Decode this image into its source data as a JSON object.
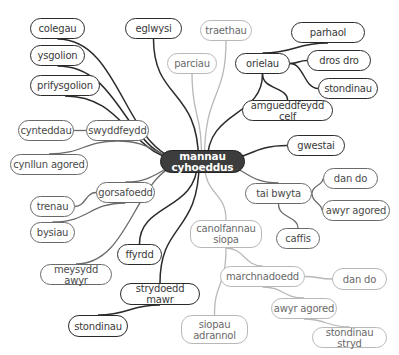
{
  "diagram": {
    "type": "mind-map",
    "center": {
      "id": "center",
      "label": "mannau\ncyhoeddus"
    },
    "colors": {
      "center_fill": "#3d3d3d",
      "center_text": "#ffffff",
      "dark_branch": "#2b2b2b",
      "mid_branch": "#6a6a6a",
      "light_branch": "#b8b8b8"
    },
    "nodes": [
      {
        "id": "colegau",
        "label": "colegau",
        "style": "dark",
        "x": 30,
        "y": 18,
        "w": 55,
        "h": 21
      },
      {
        "id": "ysgolion",
        "label": "ysgolion",
        "style": "dark",
        "x": 30,
        "y": 45,
        "w": 55,
        "h": 21
      },
      {
        "id": "prifysgolion",
        "label": "prifysgolion",
        "style": "dark",
        "x": 30,
        "y": 75,
        "w": 70,
        "h": 21
      },
      {
        "id": "eglwysi",
        "label": "eglwysi",
        "style": "dark",
        "x": 125,
        "y": 18,
        "w": 57,
        "h": 21
      },
      {
        "id": "traethau",
        "label": "traethau",
        "style": "light",
        "x": 200,
        "y": 20,
        "w": 52,
        "h": 21
      },
      {
        "id": "parciau",
        "label": "parciau",
        "style": "light",
        "x": 167,
        "y": 53,
        "w": 50,
        "h": 21
      },
      {
        "id": "orielau",
        "label": "orielau",
        "style": "dark",
        "x": 235,
        "y": 53,
        "w": 55,
        "h": 21
      },
      {
        "id": "parhaol",
        "label": "parhaol",
        "style": "dark",
        "x": 291,
        "y": 22,
        "w": 74,
        "h": 21
      },
      {
        "id": "dros_dro",
        "label": "dros dro",
        "style": "dark",
        "x": 307,
        "y": 50,
        "w": 64,
        "h": 21
      },
      {
        "id": "stondinau_tr",
        "label": "stondinau",
        "style": "dark",
        "x": 318,
        "y": 78,
        "w": 60,
        "h": 21
      },
      {
        "id": "amgueddfeydd_celf",
        "label": "amgueddfeydd celf",
        "style": "dark",
        "x": 242,
        "y": 100,
        "w": 91,
        "h": 21
      },
      {
        "id": "gwestai",
        "label": "gwestai",
        "style": "dark",
        "x": 287,
        "y": 135,
        "w": 58,
        "h": 21
      },
      {
        "id": "cynteddau",
        "label": "cynteddau",
        "style": "mid",
        "x": 18,
        "y": 120,
        "w": 56,
        "h": 21
      },
      {
        "id": "swyddfeydd",
        "label": "swyddfeydd",
        "style": "mid",
        "x": 86,
        "y": 120,
        "w": 63,
        "h": 21
      },
      {
        "id": "cynllun_agored",
        "label": "cynllun agored",
        "style": "mid",
        "x": 10,
        "y": 154,
        "w": 78,
        "h": 21
      },
      {
        "id": "gorsafoedd",
        "label": "gorsafoedd",
        "style": "mid",
        "x": 96,
        "y": 182,
        "w": 59,
        "h": 21
      },
      {
        "id": "tai_bwyta",
        "label": "tai bwyta",
        "style": "mid",
        "x": 245,
        "y": 183,
        "w": 67,
        "h": 21
      },
      {
        "id": "dan_do_r",
        "label": "dan do",
        "style": "mid",
        "x": 323,
        "y": 168,
        "w": 55,
        "h": 21
      },
      {
        "id": "awyr_agored_r",
        "label": "awyr agored",
        "style": "mid",
        "x": 322,
        "y": 200,
        "w": 68,
        "h": 21
      },
      {
        "id": "trenau",
        "label": "trenau",
        "style": "mid",
        "x": 30,
        "y": 196,
        "w": 45,
        "h": 21
      },
      {
        "id": "bysiau",
        "label": "bysiau",
        "style": "mid",
        "x": 30,
        "y": 222,
        "w": 45,
        "h": 21
      },
      {
        "id": "caffis",
        "label": "caffis",
        "style": "mid",
        "x": 276,
        "y": 228,
        "w": 44,
        "h": 21
      },
      {
        "id": "canolfannau_siopa",
        "label": "canolfannau\nsiopa",
        "style": "light",
        "x": 190,
        "y": 220,
        "w": 72,
        "h": 28
      },
      {
        "id": "ffyrdd",
        "label": "ffyrdd",
        "style": "dark",
        "x": 117,
        "y": 244,
        "w": 45,
        "h": 21
      },
      {
        "id": "meysydd_awyr",
        "label": "meysydd awyr",
        "style": "mid",
        "x": 40,
        "y": 264,
        "w": 72,
        "h": 21
      },
      {
        "id": "marchnadoedd",
        "label": "marchnadoedd",
        "style": "light",
        "x": 220,
        "y": 266,
        "w": 85,
        "h": 21
      },
      {
        "id": "dan_do_l",
        "label": "dan do",
        "style": "light",
        "x": 332,
        "y": 268,
        "w": 55,
        "h": 22
      },
      {
        "id": "strydoedd_mawr",
        "label": "strydoedd mawr",
        "style": "dark",
        "x": 120,
        "y": 283,
        "w": 80,
        "h": 22
      },
      {
        "id": "awyr_agored_l",
        "label": "awyr agored",
        "style": "light",
        "x": 271,
        "y": 298,
        "w": 66,
        "h": 21
      },
      {
        "id": "stondinau_bl",
        "label": "stondinau",
        "style": "dark",
        "x": 68,
        "y": 315,
        "w": 60,
        "h": 22
      },
      {
        "id": "siopau_adrannol",
        "label": "siopau\nadrannol",
        "style": "light",
        "x": 181,
        "y": 315,
        "w": 67,
        "h": 29
      },
      {
        "id": "stondinau_stryd",
        "label": "stondinau stryd",
        "style": "light",
        "x": 312,
        "y": 327,
        "w": 75,
        "h": 21
      }
    ],
    "edges": [
      {
        "from": "center",
        "to": "colegau",
        "style": "dark"
      },
      {
        "from": "center",
        "to": "ysgolion",
        "style": "dark"
      },
      {
        "from": "center",
        "to": "prifysgolion",
        "style": "dark"
      },
      {
        "from": "center",
        "to": "eglwysi",
        "style": "dark"
      },
      {
        "from": "center",
        "to": "traethau",
        "style": "light"
      },
      {
        "from": "center",
        "to": "parciau",
        "style": "light"
      },
      {
        "from": "center",
        "to": "orielau",
        "style": "dark"
      },
      {
        "from": "orielau",
        "to": "parhaol",
        "style": "dark"
      },
      {
        "from": "orielau",
        "to": "dros_dro",
        "style": "dark"
      },
      {
        "from": "orielau",
        "to": "stondinau_tr",
        "style": "dark"
      },
      {
        "from": "orielau",
        "to": "amgueddfeydd_celf",
        "style": "dark"
      },
      {
        "from": "center",
        "to": "gwestai",
        "style": "dark"
      },
      {
        "from": "center",
        "to": "swyddfeydd",
        "style": "mid"
      },
      {
        "from": "swyddfeydd",
        "to": "cynteddau",
        "style": "mid"
      },
      {
        "from": "swyddfeydd",
        "to": "cynllun_agored",
        "style": "mid"
      },
      {
        "from": "center",
        "to": "gorsafoedd",
        "style": "mid"
      },
      {
        "from": "gorsafoedd",
        "to": "trenau",
        "style": "mid"
      },
      {
        "from": "gorsafoedd",
        "to": "bysiau",
        "style": "mid"
      },
      {
        "from": "center",
        "to": "meysydd_awyr",
        "style": "mid"
      },
      {
        "from": "center",
        "to": "tai_bwyta",
        "style": "mid"
      },
      {
        "from": "tai_bwyta",
        "to": "dan_do_r",
        "style": "mid"
      },
      {
        "from": "tai_bwyta",
        "to": "awyr_agored_r",
        "style": "mid"
      },
      {
        "from": "tai_bwyta",
        "to": "caffis",
        "style": "mid"
      },
      {
        "from": "center",
        "to": "ffyrdd",
        "style": "dark"
      },
      {
        "from": "center",
        "to": "strydoedd_mawr",
        "style": "dark"
      },
      {
        "from": "strydoedd_mawr",
        "to": "stondinau_bl",
        "style": "dark"
      },
      {
        "from": "center",
        "to": "canolfannau_siopa",
        "style": "light"
      },
      {
        "from": "canolfannau_siopa",
        "to": "marchnadoedd",
        "style": "light"
      },
      {
        "from": "canolfannau_siopa",
        "to": "siopau_adrannol",
        "style": "light"
      },
      {
        "from": "marchnadoedd",
        "to": "dan_do_l",
        "style": "light"
      },
      {
        "from": "marchnadoedd",
        "to": "awyr_agored_l",
        "style": "light"
      },
      {
        "from": "awyr_agored_l",
        "to": "stondinau_stryd",
        "style": "light"
      }
    ]
  },
  "center_node": {
    "x": 160,
    "y": 150,
    "w": 85,
    "h": 23
  }
}
